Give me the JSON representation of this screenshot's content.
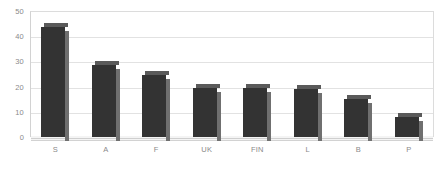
{
  "chart_data": {
    "type": "bar",
    "title": "",
    "subtitle": "",
    "xlabel": "",
    "ylabel": "",
    "categories": [
      "S",
      "A",
      "F",
      "UK",
      "FIN",
      "L",
      "B",
      "P"
    ],
    "values": [
      43.5,
      28.5,
      24.5,
      19.5,
      19.5,
      19,
      15,
      8
    ],
    "series": [
      {
        "name": "",
        "values": [
          43.5,
          28.5,
          24.5,
          19.5,
          19.5,
          19,
          15,
          8
        ]
      }
    ],
    "ylim": [
      0,
      50
    ],
    "yticks": [
      0,
      10,
      20,
      30,
      40,
      50
    ],
    "ytick_labels": [
      "0",
      "10",
      "20",
      "30",
      "40",
      "50"
    ],
    "grid": true,
    "legend": false,
    "legend_position": "none",
    "bar_color": "#333333",
    "bar_side_color": "#6f6f6f",
    "bar_top_color": "#5a5a5a",
    "gridline_color": "#e2e2e2",
    "axis_color": "#cfcfcf",
    "tick_label_color": "#8a8a8a",
    "background_color": "#ffffff"
  }
}
